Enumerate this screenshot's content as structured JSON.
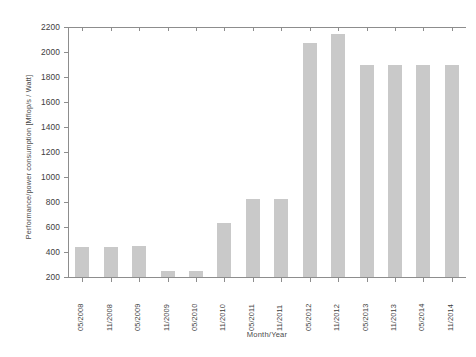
{
  "chart_data": {
    "type": "bar",
    "title": "",
    "xlabel": "Month/Year",
    "ylabel": "Performance/power consumption [Mflop/s / Watt]",
    "categories": [
      "05/2008",
      "11/2008",
      "05/2009",
      "11/2009",
      "05/2010",
      "11/2010",
      "05/2011",
      "11/2011",
      "05/2012",
      "11/2012",
      "05/2013",
      "11/2013",
      "05/2014",
      "11/2014"
    ],
    "values": [
      440,
      440,
      445,
      250,
      250,
      630,
      825,
      825,
      2075,
      2145,
      1900,
      1900,
      1900,
      1900
    ],
    "ylim": [
      200,
      2200
    ],
    "ytick_labels": [
      "200",
      "400",
      "600",
      "800",
      "1000",
      "1200",
      "1400",
      "1600",
      "1800",
      "2000",
      "2200"
    ],
    "ytick_values": [
      200,
      400,
      600,
      800,
      1000,
      1200,
      1400,
      1600,
      1800,
      2000,
      2200
    ],
    "grid": false,
    "legend": null,
    "legend_position": "none",
    "bar_color": "#c9c9c9",
    "axis_color": "#8d8d8d",
    "text_color": "#3d3d3d",
    "background": "#ffffff"
  }
}
